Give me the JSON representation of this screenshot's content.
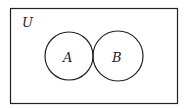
{
  "diagram": {
    "type": "venn",
    "universe_label": "U",
    "sets": [
      {
        "label": "A"
      },
      {
        "label": "B"
      }
    ],
    "relationship": "disjoint (tangent circles)",
    "colors": {
      "stroke": "#222222",
      "background": "#ffffff"
    }
  }
}
